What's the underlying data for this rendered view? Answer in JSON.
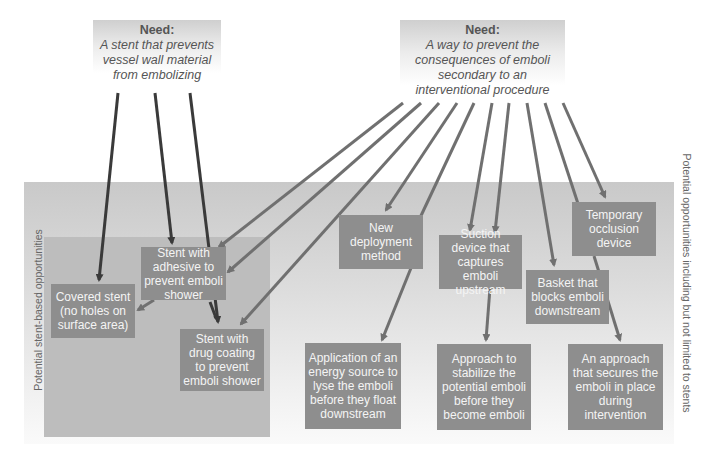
{
  "needs": [
    {
      "title": "Need:",
      "description": "A stent that prevents vessel wall material from embolizing"
    },
    {
      "title": "Need:",
      "description": "A way to prevent the consequences of emboli secondary to an interventional procedure"
    }
  ],
  "regions": {
    "stent_based_label": "Potential stent-based opportunities",
    "all_opportunities_label": "Potential opportunities including but not limited to stents"
  },
  "boxes": {
    "covered_stent": "Covered stent (no holes on surface area)",
    "stent_adhesive": "Stent with adhesive to prevent emboli shower",
    "stent_drug": "Stent with drug coating to prevent emboli shower",
    "new_deployment": "New deployment method",
    "suction_device": "Suction device that captures emboli upstream",
    "basket": "Basket that blocks emboli downstream",
    "temporary_occlusion": "Temporary occlusion device",
    "energy_source": "Application of an energy source to lyse the emboli before they float downstream",
    "stabilize": "Approach to stabilize the potential emboli before they become emboli",
    "secures": "An approach that secures the emboli in place during intervention"
  },
  "colors": {
    "arrow_dark": "#3a3a3a",
    "arrow_mid": "#707070",
    "box_fill": "#8e8e8e",
    "box_text": "#f4f4f4"
  }
}
